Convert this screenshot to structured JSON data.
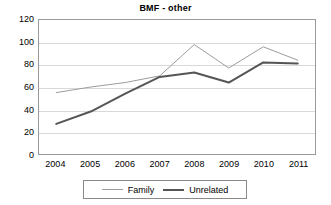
{
  "chart_data": {
    "type": "line",
    "title": "BMF - other",
    "xlabel": "",
    "ylabel": "",
    "categories": [
      "2004",
      "2005",
      "2006",
      "2007",
      "2008",
      "2009",
      "2010",
      "2011"
    ],
    "series": [
      {
        "name": "Family",
        "values": [
          55,
          60,
          64,
          70,
          98,
          77,
          96,
          84
        ],
        "color": "#9c9c9c",
        "width": 1
      },
      {
        "name": "Unrelated",
        "values": [
          27,
          38,
          54,
          69,
          73,
          64,
          82,
          81
        ],
        "color": "#555555",
        "width": 2
      }
    ],
    "ylim": [
      0,
      120
    ],
    "yticks": [
      0,
      20,
      40,
      60,
      80,
      100,
      120
    ],
    "ytick_labels": [
      "0",
      "20",
      "40",
      "60",
      "80",
      "100",
      "120"
    ],
    "grid": true,
    "legend_position": "bottom"
  },
  "legend": {
    "entries": [
      {
        "label": "Family"
      },
      {
        "label": "Unrelated"
      }
    ]
  }
}
